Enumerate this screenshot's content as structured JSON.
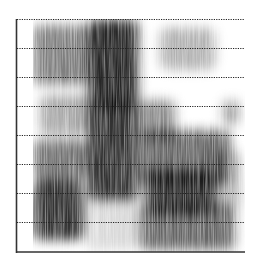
{
  "chart_data": {
    "type": "heatmap",
    "subtype": "spectrogram",
    "title": "",
    "xlabel": "",
    "ylabel": "",
    "colormap": "grayscale (white = low energy, black = high energy)",
    "grid": {
      "horizontal": true,
      "style": "dotted",
      "line_count": 8
    },
    "axes": {
      "left_axis": true,
      "bottom_axis": true,
      "tick_labels": "none"
    },
    "plot_area": {
      "x0": 16,
      "y0": 19,
      "x1": 245,
      "y1": 252
    },
    "gridlines_y": [
      19,
      48,
      77,
      106,
      135,
      164,
      193,
      222
    ],
    "segments": [
      {
        "name": "segment-1",
        "x_range": [
          33,
          88
        ],
        "description": "medium-intensity broadband energy, darker formant bands at mid and low frequencies",
        "intensity": 0.45
      },
      {
        "name": "segment-2",
        "x_range": [
          88,
          138
        ],
        "description": "strong dark broadband energy across full frequency range",
        "intensity": 0.85
      },
      {
        "name": "segment-3",
        "x_range": [
          138,
          243
        ],
        "description": "weak high-frequency noise, dark low-frequency formant region",
        "intensity": 0.5
      }
    ],
    "blobs": [
      {
        "x": 33,
        "y": 25,
        "w": 55,
        "h": 60,
        "intensity": 0.5
      },
      {
        "x": 40,
        "y": 95,
        "w": 48,
        "h": 40,
        "intensity": 0.35
      },
      {
        "x": 33,
        "y": 140,
        "w": 55,
        "h": 40,
        "intensity": 0.55
      },
      {
        "x": 33,
        "y": 180,
        "w": 50,
        "h": 60,
        "intensity": 0.8
      },
      {
        "x": 85,
        "y": 195,
        "w": 55,
        "h": 55,
        "intensity": 0.15
      },
      {
        "x": 88,
        "y": 20,
        "w": 50,
        "h": 90,
        "intensity": 0.85
      },
      {
        "x": 88,
        "y": 100,
        "w": 50,
        "h": 100,
        "intensity": 0.8
      },
      {
        "x": 160,
        "y": 28,
        "w": 55,
        "h": 42,
        "intensity": 0.3
      },
      {
        "x": 140,
        "y": 100,
        "w": 35,
        "h": 40,
        "intensity": 0.45
      },
      {
        "x": 140,
        "y": 130,
        "w": 90,
        "h": 55,
        "intensity": 0.6
      },
      {
        "x": 145,
        "y": 170,
        "w": 70,
        "h": 45,
        "intensity": 0.8
      },
      {
        "x": 140,
        "y": 205,
        "w": 95,
        "h": 45,
        "intensity": 0.6
      },
      {
        "x": 222,
        "y": 100,
        "w": 18,
        "h": 25,
        "intensity": 0.35
      },
      {
        "x": 210,
        "y": 150,
        "w": 30,
        "h": 60,
        "intensity": 0.3
      }
    ]
  },
  "colors": {
    "background": "#ffffff",
    "axis": "#333333",
    "gridline": "#222222",
    "ink": "#000000"
  }
}
